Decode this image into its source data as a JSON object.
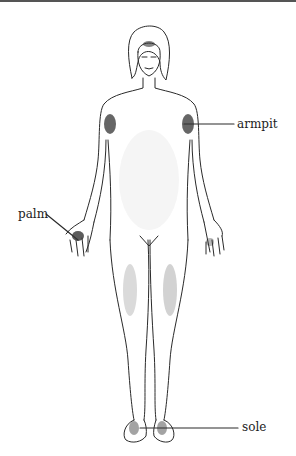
{
  "diagram": {
    "labels": [
      {
        "id": "armpit",
        "text": "armpit"
      },
      {
        "id": "palm",
        "text": "palm"
      },
      {
        "id": "sole",
        "text": "sole"
      }
    ],
    "colors": {
      "line": "#2a2a2a",
      "stipple": "#333333",
      "background": "#ffffff"
    }
  }
}
